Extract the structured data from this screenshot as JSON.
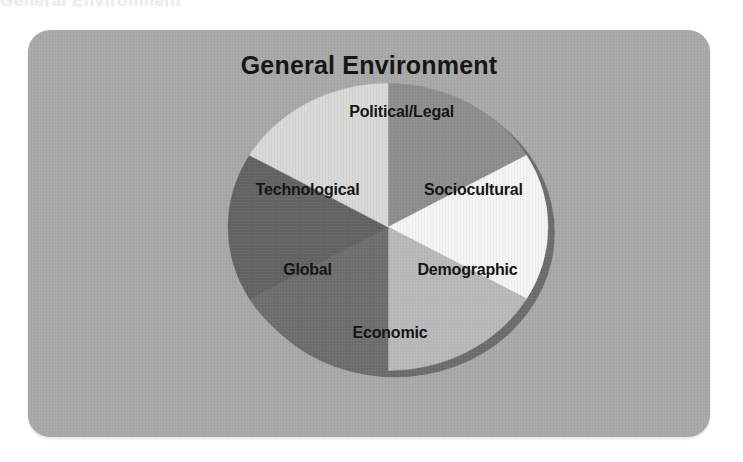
{
  "page": {
    "background_color": "#ffffff",
    "top_edge_artifact_text": "General Environment"
  },
  "card": {
    "background_color": "#a9a9a9",
    "corner_radius_px": 22
  },
  "figure": {
    "title": "General Environment",
    "title_color": "#161616",
    "shadow_color": "#6d6d6d"
  },
  "chart_data": {
    "type": "pie",
    "title": "General Environment",
    "xlabel": "",
    "ylabel": "",
    "legend_position": "none",
    "grid": false,
    "note": "Six equal wedges of 60 degrees each, labelled inside the slice.",
    "categories": [
      "Political/Legal",
      "Sociocultural",
      "Demographic",
      "Economic",
      "Global",
      "Technological"
    ],
    "values": [
      1,
      1,
      1,
      1,
      1,
      1
    ],
    "percentages": [
      16.67,
      16.67,
      16.67,
      16.67,
      16.67,
      16.67
    ],
    "colors": [
      "#8e8e8e",
      "#f4f4f2",
      "#b9b9b9",
      "#6e6e6e",
      "#636363",
      "#d8d8d6"
    ],
    "slices": [
      {
        "label": "Political/Legal",
        "color": "#8e8e8e",
        "start_angle_deg": -90,
        "end_angle_deg": -30,
        "label_x": 14,
        "label_y": -118
      },
      {
        "label": "Sociocultural",
        "color": "#f4f4f2",
        "start_angle_deg": -30,
        "end_angle_deg": 30,
        "label_x": 88,
        "label_y": -37
      },
      {
        "label": "Demographic",
        "color": "#b9b9b9",
        "start_angle_deg": 30,
        "end_angle_deg": 90,
        "label_x": 82,
        "label_y": 45
      },
      {
        "label": "Economic",
        "color": "#6e6e6e",
        "start_angle_deg": 90,
        "end_angle_deg": 150,
        "label_x": 2,
        "label_y": 110
      },
      {
        "label": "Global",
        "color": "#636363",
        "start_angle_deg": 150,
        "end_angle_deg": 210,
        "label_x": -83,
        "label_y": 45
      },
      {
        "label": "Technological",
        "color": "#d8d8d6",
        "start_angle_deg": 210,
        "end_angle_deg": 270,
        "label_x": -83,
        "label_y": -37
      }
    ]
  }
}
